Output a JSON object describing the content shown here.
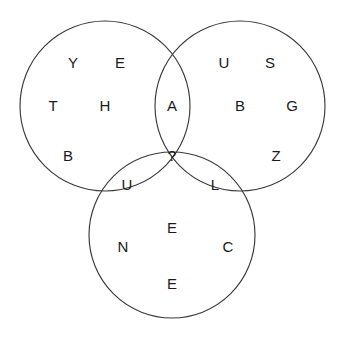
{
  "figure": {
    "type": "venn-diagram-letter-puzzle",
    "width": 346,
    "height": 340,
    "background_color": "#ffffff",
    "stroke_color": "#3a3a3a",
    "text_color": "#1b1b1b"
  },
  "circles": [
    {
      "name": "left-circle",
      "cx": 105,
      "cy": 106,
      "r": 85
    },
    {
      "name": "right-circle",
      "cx": 240,
      "cy": 106,
      "r": 85
    },
    {
      "name": "bottom-circle",
      "cx": 172,
      "cy": 235,
      "r": 83
    }
  ],
  "letters": [
    {
      "id": "left-y",
      "text": "Y",
      "x": 73,
      "y": 62,
      "region": "left-only"
    },
    {
      "id": "left-e",
      "text": "E",
      "x": 120,
      "y": 62,
      "region": "left-only"
    },
    {
      "id": "left-t",
      "text": "T",
      "x": 53,
      "y": 105,
      "region": "left-only"
    },
    {
      "id": "left-h",
      "text": "H",
      "x": 105,
      "y": 105,
      "region": "left-only"
    },
    {
      "id": "left-b",
      "text": "B",
      "x": 68,
      "y": 155,
      "region": "left-only"
    },
    {
      "id": "top-overlap-a",
      "text": "A",
      "x": 172,
      "y": 105,
      "region": "left-right-overlap"
    },
    {
      "id": "right-u",
      "text": "U",
      "x": 224,
      "y": 62,
      "region": "right-only"
    },
    {
      "id": "right-s",
      "text": "S",
      "x": 270,
      "y": 62,
      "region": "right-only"
    },
    {
      "id": "right-b",
      "text": "B",
      "x": 240,
      "y": 105,
      "region": "right-only"
    },
    {
      "id": "right-g",
      "text": "G",
      "x": 292,
      "y": 105,
      "region": "right-only"
    },
    {
      "id": "right-z",
      "text": "Z",
      "x": 276,
      "y": 155,
      "region": "right-only"
    },
    {
      "id": "center-q",
      "text": "?",
      "x": 172,
      "y": 155,
      "region": "triple-overlap"
    },
    {
      "id": "left-bottom-u",
      "text": "U",
      "x": 127,
      "y": 184,
      "region": "left-bottom-overlap"
    },
    {
      "id": "right-bottom-l",
      "text": "L",
      "x": 215,
      "y": 184,
      "region": "right-bottom-overlap"
    },
    {
      "id": "bottom-e-top",
      "text": "E",
      "x": 172,
      "y": 227,
      "region": "bottom-only"
    },
    {
      "id": "bottom-n",
      "text": "N",
      "x": 123,
      "y": 246,
      "region": "bottom-only"
    },
    {
      "id": "bottom-c",
      "text": "C",
      "x": 228,
      "y": 246,
      "region": "bottom-only"
    },
    {
      "id": "bottom-e-low",
      "text": "E",
      "x": 172,
      "y": 283,
      "region": "bottom-only"
    }
  ]
}
